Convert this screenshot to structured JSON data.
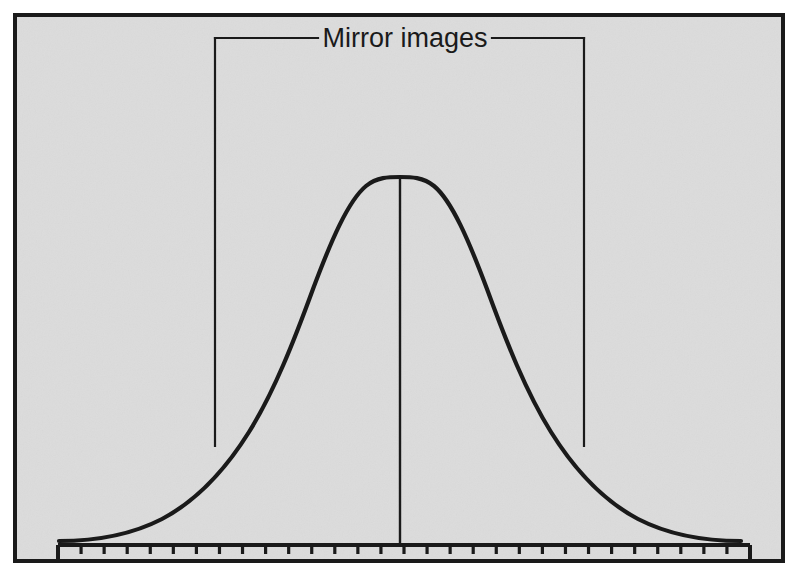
{
  "figure": {
    "title": "Mirror images",
    "annotation_label": "Mirror images",
    "background_color": "#e9e9e9",
    "ink_color": "#1a1a1a",
    "frame": {
      "x": 13,
      "y": 13,
      "width": 772,
      "height": 550,
      "border_width": 4
    }
  },
  "annotation": {
    "label": "Mirror images",
    "bracket": {
      "left_x": 215,
      "right_x": 584,
      "top_y": 38,
      "bottom_y": 446,
      "label_gap_left": 318,
      "label_gap_right": 490
    }
  },
  "axis": {
    "x_start": 58,
    "x_end": 750,
    "y": 545,
    "tick_count": 31,
    "tick_spacing": 23.07,
    "tick_height_minor": 9,
    "tick_height_major": 17,
    "line_width": 4
  },
  "center_line": {
    "x": 400,
    "y_top": 177,
    "y_bottom": 545
  },
  "chart_data": {
    "type": "line",
    "title": "Mirror images",
    "subtitle": "",
    "xlabel": "",
    "ylabel": "",
    "grid": false,
    "legend": "none",
    "annotations": [
      {
        "text": "Mirror images",
        "kind": "bracket-span",
        "from_x": -1.6,
        "to_x": 1.6,
        "note": "Bracket spanning symmetric halves of the normal curve"
      },
      {
        "text": "",
        "kind": "center-vertical-line",
        "at_x": 0,
        "note": "Vertical line at the mean marking the axis of symmetry"
      }
    ],
    "xlim": [
      -3.0,
      3.0
    ],
    "ylim": [
      0,
      1
    ],
    "x": [
      -3.0,
      -2.8,
      -2.6,
      -2.4,
      -2.2,
      -2.0,
      -1.8,
      -1.6,
      -1.4,
      -1.2,
      -1.0,
      -0.8,
      -0.6,
      -0.4,
      -0.2,
      0.0,
      0.2,
      0.4,
      0.6,
      0.8,
      1.0,
      1.2,
      1.4,
      1.6,
      1.8,
      2.0,
      2.2,
      2.4,
      2.6,
      2.8,
      3.0
    ],
    "y": [
      0.011,
      0.02,
      0.034,
      0.056,
      0.089,
      0.135,
      0.198,
      0.278,
      0.375,
      0.487,
      0.607,
      0.726,
      0.835,
      0.923,
      0.98,
      1.0,
      0.98,
      0.923,
      0.835,
      0.726,
      0.607,
      0.487,
      0.375,
      0.278,
      0.198,
      0.135,
      0.089,
      0.056,
      0.034,
      0.02,
      0.011
    ],
    "series": [
      {
        "name": "normal curve",
        "values": [
          0.011,
          0.02,
          0.034,
          0.056,
          0.089,
          0.135,
          0.198,
          0.278,
          0.375,
          0.487,
          0.607,
          0.726,
          0.835,
          0.923,
          0.98,
          1.0,
          0.98,
          0.923,
          0.835,
          0.726,
          0.607,
          0.487,
          0.375,
          0.278,
          0.198,
          0.135,
          0.089,
          0.056,
          0.034,
          0.02,
          0.011
        ]
      }
    ]
  }
}
